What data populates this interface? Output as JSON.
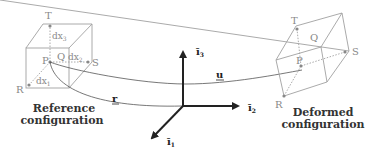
{
  "reference": {
    "caption_line1": "Reference",
    "caption_line2": "configuration",
    "vertices": {
      "T": "T",
      "P": "P",
      "Q": "Q",
      "S": "S",
      "R": "R"
    },
    "edges": {
      "dx1": "dx",
      "dx1_sub": "1",
      "dx2": "dx",
      "dx2_sub": "2",
      "dx3": "dx",
      "dx3_sub": "3"
    }
  },
  "deformed": {
    "caption_line1": "Deformed",
    "caption_line2": "configuration",
    "vertices": {
      "T": "T",
      "P": "P",
      "Q": "Q",
      "S": "S",
      "R": "R"
    }
  },
  "axes": {
    "i1": "ī",
    "i1_sub": "1",
    "i2": "ī",
    "i2_sub": "2",
    "i3": "ī",
    "i3_sub": "3"
  },
  "vectors": {
    "r": "r",
    "u": "u"
  },
  "colors": {
    "cube": "#999999",
    "axes": "#222222",
    "curve": "#555555"
  }
}
